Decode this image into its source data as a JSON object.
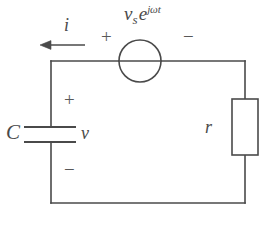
{
  "figure": {
    "name": "rc-series-circuit-with-ac-source",
    "background_color": "#ffffff",
    "line_color": "#4a4a4a",
    "text_color": "#4a4a4a"
  },
  "labels": {
    "source_symbol": "v",
    "source_subscript": "s",
    "source_exponential_base": "e",
    "source_exponent": "jωt",
    "current": "i",
    "capacitor": "C",
    "capacitor_voltage": "v",
    "resistor": "r"
  },
  "polarity": {
    "source_plus": "+",
    "source_minus": "−",
    "capacitor_plus": "+",
    "capacitor_minus": "−"
  },
  "geometry": {
    "loop_left_x": 51,
    "loop_right_x": 245,
    "loop_top_y": 61,
    "loop_bottom_y": 203,
    "source_center_x": 140,
    "source_center_y": 61,
    "source_radius": 21,
    "capacitor_plate_left_x": 24,
    "capacitor_plate_right_x": 76,
    "capacitor_top_plate_y": 127,
    "capacitor_bottom_plate_y": 142,
    "resistor_left_x": 232,
    "resistor_right_x": 258,
    "resistor_top_y": 99,
    "resistor_bottom_y": 155,
    "arrow_tail_x": 85,
    "arrow_head_x": 40,
    "arrow_y": 45
  }
}
